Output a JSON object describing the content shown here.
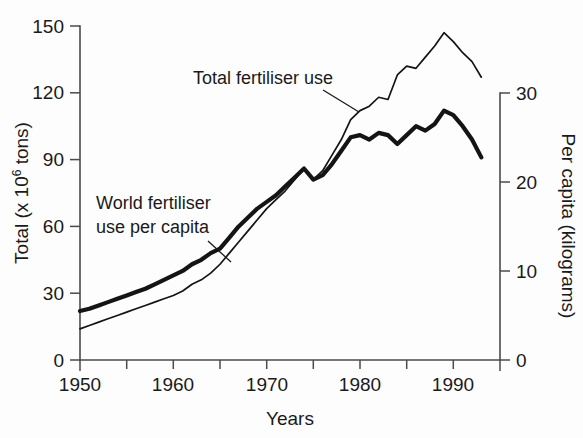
{
  "chart_data": {
    "type": "line",
    "title": "",
    "xlabel": "Years",
    "ylabel": "Total (x 10⁶ tons)",
    "y2label": "Per capita (kilograms)",
    "xlim": [
      1950,
      1995
    ],
    "ylim": [
      0,
      150
    ],
    "y2lim": [
      0,
      30
    ],
    "grid": false,
    "legend_position": "inline-annotations",
    "xticks": [
      1950,
      1955,
      1960,
      1965,
      1970,
      1975,
      1980,
      1985,
      1990,
      1995
    ],
    "xticklabels": [
      "1950",
      "",
      "1960",
      "",
      "1970",
      "",
      "1980",
      "",
      "1990",
      ""
    ],
    "yticks": [
      0,
      30,
      60,
      90,
      120,
      150
    ],
    "yticklabels": [
      "0",
      "30",
      "60",
      "90",
      "120",
      "150"
    ],
    "y2ticks": [
      0,
      10,
      20,
      30
    ],
    "y2ticklabels": [
      "0",
      "10",
      "20",
      "30"
    ],
    "x": [
      1950,
      1951,
      1952,
      1953,
      1954,
      1955,
      1956,
      1957,
      1958,
      1959,
      1960,
      1961,
      1962,
      1963,
      1964,
      1965,
      1966,
      1967,
      1968,
      1969,
      1970,
      1971,
      1972,
      1973,
      1974,
      1975,
      1976,
      1977,
      1978,
      1979,
      1980,
      1981,
      1982,
      1983,
      1984,
      1985,
      1986,
      1987,
      1988,
      1989,
      1990,
      1991,
      1992,
      1993
    ],
    "series": [
      {
        "name": "Total fertiliser use",
        "axis": "left",
        "units": "x 10^6 tons",
        "line_style": "thin",
        "values": [
          14,
          15.5,
          17,
          18.5,
          20,
          21.5,
          23,
          24.5,
          26,
          27.5,
          29,
          31,
          34,
          36,
          39,
          43,
          48,
          53,
          58,
          63,
          68,
          72,
          76,
          81,
          86,
          81,
          85,
          92,
          99,
          108,
          112,
          114,
          118,
          117,
          128,
          132,
          131,
          136,
          141,
          147,
          143,
          138,
          134,
          127
        ]
      },
      {
        "name": "World fertiliser use per capita",
        "axis": "right",
        "units": "kilograms",
        "line_style": "thick",
        "values_left_scale": [
          22,
          23,
          24.5,
          26,
          27.5,
          29,
          30.5,
          32,
          34,
          36,
          38,
          40,
          43,
          45,
          48,
          50,
          55,
          60,
          64,
          68,
          71,
          74,
          78,
          82,
          86,
          81,
          83,
          88,
          94,
          100,
          101,
          99,
          102,
          101,
          97,
          101,
          105,
          103,
          106,
          112,
          110,
          105,
          99,
          91
        ],
        "values": [
          4.4,
          4.6,
          4.9,
          5.2,
          5.5,
          5.8,
          6.1,
          6.4,
          6.8,
          7.2,
          7.6,
          8.0,
          8.6,
          9.0,
          9.6,
          10.0,
          11.0,
          12.0,
          12.8,
          13.6,
          14.2,
          14.8,
          15.6,
          16.4,
          17.2,
          16.2,
          16.6,
          17.6,
          18.8,
          20.0,
          20.2,
          19.8,
          20.4,
          20.2,
          19.4,
          20.2,
          21.0,
          20.6,
          21.2,
          22.4,
          22.0,
          21.0,
          19.8,
          18.2
        ]
      }
    ],
    "annotations": [
      {
        "id": "total-fertiliser-use-label",
        "text": "Total fertiliser use",
        "text_x": 193,
        "text_y": 84,
        "leader_from": [
          323,
          90
        ],
        "leader_to": [
          359,
          112
        ]
      },
      {
        "id": "world-fertiliser-use-per-capita-label",
        "text_line1": "World fertiliser",
        "text_line2": "use per capita",
        "text_x": 96,
        "text_y": 209,
        "text_y2": 233,
        "leader_from": [
          208,
          241
        ],
        "leader_to": [
          231,
          262
        ]
      }
    ]
  },
  "colors": {
    "background": "#fdfdfd",
    "axis": "#4a4a4a",
    "line": "#141414",
    "text": "#1a1a1a"
  },
  "axes": {
    "left_title_prefix": "Total (x 10",
    "left_title_sup": "6",
    "left_title_suffix": " tons)",
    "right_title": "Per capita (kilograms)",
    "x_title": "Years"
  }
}
